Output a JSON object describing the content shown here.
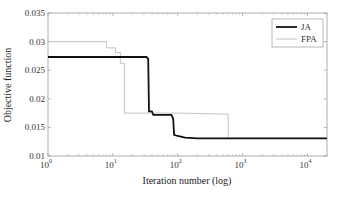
{
  "chart_data": {
    "type": "line",
    "title": "",
    "xlabel": "Iteration number (log)",
    "ylabel": "Objective function",
    "xscale": "log",
    "xlim": [
      1,
      20000
    ],
    "ylim": [
      0.01,
      0.035
    ],
    "x_ticks": [
      "10^0",
      "10^1",
      "10^2",
      "10^3",
      "10^4"
    ],
    "y_ticks": [
      "0.01",
      "0.015",
      "0.02",
      "0.025",
      "0.03",
      "0.035"
    ],
    "grid": false,
    "legend_position": "upper right",
    "series": [
      {
        "name": "JA",
        "style": "thick black",
        "color": "#111111",
        "points": [
          [
            1,
            0.0273
          ],
          [
            33,
            0.0273
          ],
          [
            35,
            0.027
          ],
          [
            36,
            0.0178
          ],
          [
            40,
            0.0178
          ],
          [
            42,
            0.0172
          ],
          [
            80,
            0.0172
          ],
          [
            85,
            0.0165
          ],
          [
            88,
            0.0137
          ],
          [
            100,
            0.0135
          ],
          [
            130,
            0.0132
          ],
          [
            200,
            0.0131
          ],
          [
            20000,
            0.0131
          ]
        ]
      },
      {
        "name": "FPA",
        "style": "thin light gray",
        "color": "#bbbbbb",
        "points": [
          [
            1,
            0.03
          ],
          [
            8,
            0.03
          ],
          [
            8,
            0.0289
          ],
          [
            11,
            0.0289
          ],
          [
            11,
            0.0281
          ],
          [
            13,
            0.0281
          ],
          [
            13,
            0.0262
          ],
          [
            15,
            0.0262
          ],
          [
            15,
            0.0175
          ],
          [
            100,
            0.0175
          ],
          [
            600,
            0.0173
          ],
          [
            600,
            0.0131
          ],
          [
            20000,
            0.0131
          ]
        ]
      }
    ]
  }
}
